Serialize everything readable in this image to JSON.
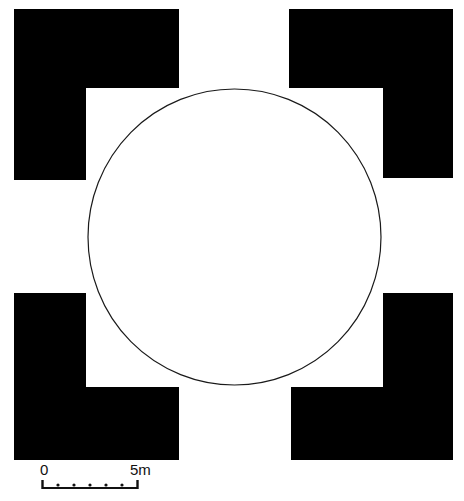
{
  "figure": {
    "background_color": "#ffffff",
    "ink_color": "#000000",
    "line_color": "#1a1a1a"
  },
  "plan": {
    "outer_frame": {
      "name": "black masonry frame",
      "fill_color": "#000000",
      "x": 14,
      "y": 9,
      "width": 439,
      "height": 451
    },
    "inner_court": {
      "name": "inner white square court",
      "fill_color": "#ffffff",
      "x": 86,
      "y": 88,
      "width": 297,
      "height": 299
    },
    "gaps": [
      {
        "name": "north-gap",
        "x": 179,
        "y": 9,
        "width": 110,
        "height": 79
      },
      {
        "name": "south-gap",
        "x": 179,
        "y": 387,
        "width": 112,
        "height": 73
      },
      {
        "name": "west-gap",
        "x": 14,
        "y": 180,
        "width": 72,
        "height": 113
      },
      {
        "name": "east-gap",
        "x": 383,
        "y": 178,
        "width": 70,
        "height": 115
      }
    ],
    "circle": {
      "name": "inscribed circle",
      "center_x": 234.5,
      "center_y": 237,
      "radius_x": 146.5,
      "radius_y": 148,
      "stroke_color": "#1a1a1a",
      "stroke_width": 1.2,
      "fill": "none"
    }
  },
  "scale": {
    "name": "scale-bar",
    "label_start": "0",
    "label_end": "5m",
    "unit": "m",
    "total_length_value": 5,
    "bar_pixel_length": 96,
    "divisions": 6,
    "tick_count": 5,
    "color": "#111111"
  },
  "chart_data": {
    "type": "table",
    "xlabel": "",
    "ylabel": "",
    "categories": [
      "outer frame side",
      "inner court side",
      "circle diameter",
      "gap width"
    ],
    "values": [
      439,
      297,
      293,
      111
    ],
    "units": "pixels",
    "scale_reference": {
      "pixels": 96,
      "metres": 5
    }
  }
}
